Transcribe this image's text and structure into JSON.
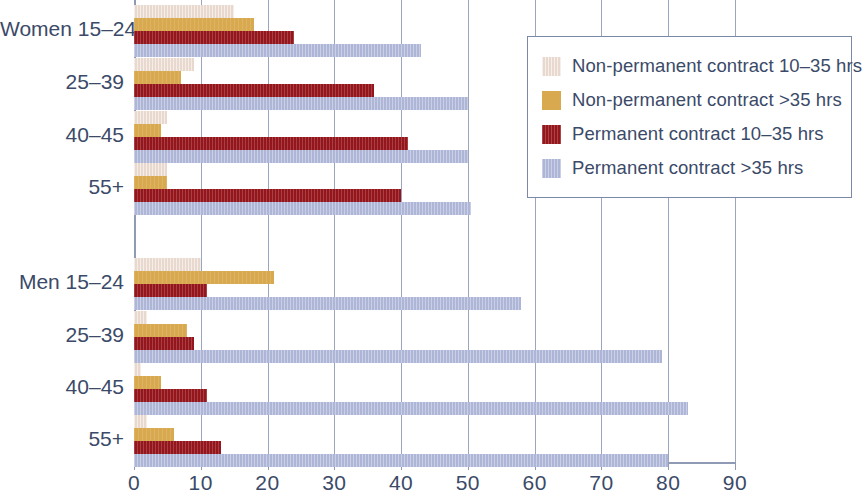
{
  "chart_data": {
    "type": "bar",
    "orientation": "horizontal",
    "title": "",
    "xlabel": "",
    "ylabel": "",
    "xlim": [
      0,
      90
    ],
    "xticks": [
      0,
      10,
      20,
      30,
      40,
      50,
      60,
      70,
      80,
      90
    ],
    "xtick_labels": [
      "0",
      "10",
      "20",
      "30",
      "40",
      "50",
      "60",
      "70",
      "80",
      "90"
    ],
    "grid": true,
    "grid_axis": "x",
    "legend_position": "upper right",
    "groups": [
      "Women",
      "Men"
    ],
    "categories": [
      "Women 15–24",
      "25–39",
      "40–45",
      "55+",
      "Men 15–24",
      "25–39",
      "40–45",
      "55+"
    ],
    "series": [
      {
        "name": "Non-permanent contract 10–35 hrs",
        "color": "#e8d8cd",
        "values": [
          15,
          9,
          5,
          5,
          10,
          2,
          1,
          2
        ]
      },
      {
        "name": "Non-permanent contract >35 hrs",
        "color": "#d8a94e",
        "values": [
          18,
          7,
          4,
          5,
          21,
          8,
          4,
          6
        ]
      },
      {
        "name": "Permanent contract 10–35 hrs",
        "color": "#94161c",
        "values": [
          24,
          36,
          41,
          40,
          11,
          9,
          11,
          13
        ]
      },
      {
        "name": "Permanent contract >35 hrs",
        "color": "#aeb6d8",
        "values": [
          43,
          50,
          50,
          50.5,
          58,
          79,
          83,
          80
        ]
      }
    ]
  },
  "legend": {
    "items": [
      {
        "label": "Non-permanent contract 10–35 hrs",
        "color": "#e8d8cd"
      },
      {
        "label": "Non-permanent contract >35 hrs",
        "color": "#d8a94e"
      },
      {
        "label": "Permanent contract 10–35 hrs",
        "color": "#94161c"
      },
      {
        "label": "Permanent contract >35 hrs",
        "color": "#aeb6d8"
      }
    ]
  },
  "axis": {
    "tick_labels": [
      "0",
      "10",
      "20",
      "30",
      "40",
      "50",
      "60",
      "70",
      "80",
      "90"
    ]
  },
  "category_labels": [
    "Women 15–24",
    "25–39",
    "40–45",
    "55+",
    "Men 15–24",
    "25–39",
    "40–45",
    "55+"
  ],
  "colors": {
    "grid": "#9aa6bd",
    "text": "#3b4a68",
    "legend_border": "#7b88a8",
    "background": "#ffffff"
  }
}
